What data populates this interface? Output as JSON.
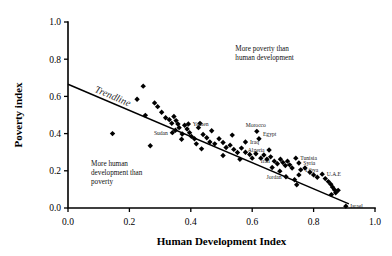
{
  "chart_data": {
    "type": "scatter",
    "title": "",
    "xlabel": "Human Development Index",
    "ylabel": "Poverty index",
    "xlim": [
      0.0,
      1.0
    ],
    "ylim": [
      0.0,
      1.0
    ],
    "grid": false,
    "legend": "none",
    "xticks": [
      "0.0",
      "0.2",
      "0.4",
      "0.6",
      "0.8",
      "1.0"
    ],
    "yticks": [
      "0.0",
      "0.2",
      "0.4",
      "0.6",
      "0.8",
      "1.0"
    ],
    "xtick_values": [
      0.0,
      0.2,
      0.4,
      0.6,
      0.8,
      1.0
    ],
    "ytick_values": [
      0.0,
      0.2,
      0.4,
      0.6,
      0.8,
      1.0
    ],
    "marker": "filled-diamond",
    "marker_color": "#000000",
    "series": [
      {
        "name": "countries",
        "points": [
          {
            "x": 0.145,
            "y": 0.4,
            "label": ""
          },
          {
            "x": 0.245,
            "y": 0.655,
            "label": ""
          },
          {
            "x": 0.225,
            "y": 0.585,
            "label": ""
          },
          {
            "x": 0.282,
            "y": 0.565,
            "label": ""
          },
          {
            "x": 0.292,
            "y": 0.545,
            "label": ""
          },
          {
            "x": 0.305,
            "y": 0.515,
            "label": ""
          },
          {
            "x": 0.268,
            "y": 0.335,
            "label": ""
          },
          {
            "x": 0.318,
            "y": 0.485,
            "label": ""
          },
          {
            "x": 0.33,
            "y": 0.475,
            "label": ""
          },
          {
            "x": 0.338,
            "y": 0.455,
            "label": ""
          },
          {
            "x": 0.345,
            "y": 0.492,
            "label": ""
          },
          {
            "x": 0.352,
            "y": 0.47,
            "label": ""
          },
          {
            "x": 0.358,
            "y": 0.452,
            "label": ""
          },
          {
            "x": 0.362,
            "y": 0.432,
            "label": ""
          },
          {
            "x": 0.35,
            "y": 0.418,
            "label": ""
          },
          {
            "x": 0.34,
            "y": 0.405,
            "label": "Sudan"
          },
          {
            "x": 0.372,
            "y": 0.398,
            "label": ""
          },
          {
            "x": 0.38,
            "y": 0.445,
            "label": ""
          },
          {
            "x": 0.392,
            "y": 0.452,
            "label": "Yemen"
          },
          {
            "x": 0.388,
            "y": 0.425,
            "label": ""
          },
          {
            "x": 0.396,
            "y": 0.405,
            "label": ""
          },
          {
            "x": 0.402,
            "y": 0.385,
            "label": ""
          },
          {
            "x": 0.37,
            "y": 0.37,
            "label": ""
          },
          {
            "x": 0.412,
            "y": 0.372,
            "label": ""
          },
          {
            "x": 0.425,
            "y": 0.432,
            "label": ""
          },
          {
            "x": 0.418,
            "y": 0.345,
            "label": ""
          },
          {
            "x": 0.44,
            "y": 0.395,
            "label": ""
          },
          {
            "x": 0.452,
            "y": 0.378,
            "label": ""
          },
          {
            "x": 0.462,
            "y": 0.355,
            "label": ""
          },
          {
            "x": 0.435,
            "y": 0.318,
            "label": ""
          },
          {
            "x": 0.478,
            "y": 0.345,
            "label": ""
          },
          {
            "x": 0.492,
            "y": 0.372,
            "label": ""
          },
          {
            "x": 0.505,
            "y": 0.352,
            "label": ""
          },
          {
            "x": 0.515,
            "y": 0.325,
            "label": ""
          },
          {
            "x": 0.528,
            "y": 0.338,
            "label": ""
          },
          {
            "x": 0.54,
            "y": 0.315,
            "label": ""
          },
          {
            "x": 0.552,
            "y": 0.298,
            "label": ""
          },
          {
            "x": 0.505,
            "y": 0.282,
            "label": ""
          },
          {
            "x": 0.565,
            "y": 0.322,
            "label": ""
          },
          {
            "x": 0.578,
            "y": 0.3,
            "label": ""
          },
          {
            "x": 0.592,
            "y": 0.288,
            "label": ""
          },
          {
            "x": 0.6,
            "y": 0.268,
            "label": ""
          },
          {
            "x": 0.56,
            "y": 0.262,
            "label": ""
          },
          {
            "x": 0.615,
            "y": 0.412,
            "label": "Morocco"
          },
          {
            "x": 0.622,
            "y": 0.372,
            "label": "Egypt"
          },
          {
            "x": 0.612,
            "y": 0.292,
            "label": ""
          },
          {
            "x": 0.628,
            "y": 0.268,
            "label": ""
          },
          {
            "x": 0.638,
            "y": 0.285,
            "label": ""
          },
          {
            "x": 0.648,
            "y": 0.262,
            "label": ""
          },
          {
            "x": 0.66,
            "y": 0.275,
            "label": ""
          },
          {
            "x": 0.672,
            "y": 0.252,
            "label": "Iran"
          },
          {
            "x": 0.682,
            "y": 0.238,
            "label": ""
          },
          {
            "x": 0.665,
            "y": 0.218,
            "label": ""
          },
          {
            "x": 0.692,
            "y": 0.262,
            "label": ""
          },
          {
            "x": 0.7,
            "y": 0.245,
            "label": ""
          },
          {
            "x": 0.708,
            "y": 0.228,
            "label": ""
          },
          {
            "x": 0.715,
            "y": 0.252,
            "label": ""
          },
          {
            "x": 0.722,
            "y": 0.232,
            "label": ""
          },
          {
            "x": 0.73,
            "y": 0.215,
            "label": ""
          },
          {
            "x": 0.742,
            "y": 0.268,
            "label": "Tunisia"
          },
          {
            "x": 0.752,
            "y": 0.242,
            "label": "Syria"
          },
          {
            "x": 0.71,
            "y": 0.168,
            "label": "Jordan"
          },
          {
            "x": 0.738,
            "y": 0.152,
            "label": ""
          },
          {
            "x": 0.745,
            "y": 0.125,
            "label": ""
          },
          {
            "x": 0.758,
            "y": 0.205,
            "label": "Libya"
          },
          {
            "x": 0.772,
            "y": 0.215,
            "label": ""
          },
          {
            "x": 0.788,
            "y": 0.192,
            "label": ""
          },
          {
            "x": 0.8,
            "y": 0.178,
            "label": ""
          },
          {
            "x": 0.812,
            "y": 0.165,
            "label": ""
          },
          {
            "x": 0.828,
            "y": 0.182,
            "label": "U.A.E"
          },
          {
            "x": 0.838,
            "y": 0.158,
            "label": ""
          },
          {
            "x": 0.848,
            "y": 0.142,
            "label": ""
          },
          {
            "x": 0.856,
            "y": 0.128,
            "label": ""
          },
          {
            "x": 0.862,
            "y": 0.112,
            "label": ""
          },
          {
            "x": 0.868,
            "y": 0.098,
            "label": ""
          },
          {
            "x": 0.872,
            "y": 0.082,
            "label": ""
          },
          {
            "x": 0.88,
            "y": 0.095,
            "label": ""
          },
          {
            "x": 0.858,
            "y": 0.072,
            "label": ""
          },
          {
            "x": 0.905,
            "y": 0.01,
            "label": "Israel"
          },
          {
            "x": 0.252,
            "y": 0.498,
            "label": ""
          },
          {
            "x": 0.43,
            "y": 0.455,
            "label": ""
          },
          {
            "x": 0.468,
            "y": 0.415,
            "label": ""
          },
          {
            "x": 0.535,
            "y": 0.392,
            "label": ""
          },
          {
            "x": 0.578,
            "y": 0.355,
            "label": "Iraq"
          },
          {
            "x": 0.655,
            "y": 0.312,
            "label": "Algeria"
          },
          {
            "x": 0.69,
            "y": 0.198,
            "label": ""
          },
          {
            "x": 0.752,
            "y": 0.178,
            "label": ""
          }
        ]
      }
    ],
    "trendline": {
      "label": "Trendline",
      "x0": 0.0,
      "y0": 0.665,
      "x1": 0.915,
      "y1": 0.022
    },
    "annotations": [
      {
        "name": "more-poverty-annotation",
        "lines": [
          "More poverty than",
          "human development"
        ],
        "x": 0.545,
        "y": 0.845
      },
      {
        "name": "more-human-development-annotation",
        "lines": [
          "More human",
          "development than",
          "poverty"
        ],
        "x": 0.075,
        "y": 0.225
      }
    ],
    "point_labels": [
      "Sudan",
      "Yemen",
      "Morocco",
      "Egypt",
      "Iraq",
      "Algeria",
      "Iran",
      "Tunisia",
      "Syria",
      "Libya",
      "Jordan",
      "U.A.E",
      "Israel"
    ]
  }
}
